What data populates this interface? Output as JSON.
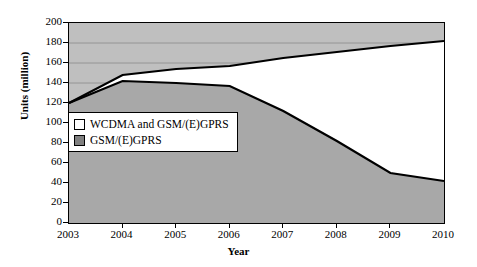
{
  "chart_data": {
    "type": "area",
    "title": "",
    "xlabel": "Year",
    "ylabel": "Units (million)",
    "categories": [
      "2003",
      "2004",
      "2005",
      "2006",
      "2007",
      "2008",
      "2009",
      "2010"
    ],
    "x": [
      2003,
      2004,
      2005,
      2006,
      2007,
      2008,
      2009,
      2010
    ],
    "ylim": [
      0,
      200
    ],
    "ytick_labels": [
      "0",
      "20",
      "40",
      "60",
      "80",
      "100",
      "120",
      "140",
      "160",
      "180",
      "200"
    ],
    "yticks": [
      0,
      20,
      40,
      60,
      80,
      100,
      120,
      140,
      160,
      180,
      200
    ],
    "grid": "horizontal",
    "legend_position": "inside-left",
    "stacked": true,
    "series": [
      {
        "name": "WCDMA and GSM/(E)GPRS",
        "color": "#ffffff",
        "values": [
          0,
          6,
          14,
          20,
          53,
          89,
          127,
          140
        ]
      },
      {
        "name": "GSM/(E)GPRS",
        "color": "#bfbfbf",
        "values": [
          120,
          142,
          140,
          137,
          112,
          82,
          50,
          42
        ]
      }
    ],
    "totals": [
      120,
      148,
      154,
      157,
      165,
      171,
      177,
      182
    ],
    "plot_background": "#bfbfbf",
    "axis_color": "#000000",
    "line_color": "#000000"
  },
  "legend": {
    "items": [
      {
        "label": "WCDMA and GSM/(E)GPRS",
        "swatch": "#ffffff"
      },
      {
        "label": "GSM/(E)GPRS",
        "swatch": "#808080"
      }
    ]
  }
}
